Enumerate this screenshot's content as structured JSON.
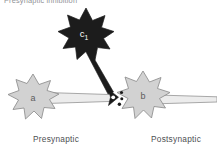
{
  "figure": {
    "title": "Presynaptic inhibition",
    "width": 217,
    "height": 159,
    "background": "#ffffff"
  },
  "labels": {
    "presynaptic": "Presynaptic",
    "postsynaptic": "Postsynaptic",
    "inhibitory_cell": "c",
    "inhibitory_cell_subscript": "1",
    "presynaptic_cell": "a",
    "postsynaptic_cell": "b"
  },
  "colors": {
    "cell_fill_light": "#d2d2d2",
    "cell_stroke": "#8c8c8c",
    "cell_fill_dark": "#1c1c1c",
    "axon_fill": "#e6e6e6",
    "axon_stroke": "#9a9a9a",
    "terminal_dark": "#1c1c1c",
    "vesicle": "#1c1c1c",
    "title_text": "#8f9196",
    "label_text": "#4d4f53"
  },
  "elements": {
    "inhibitory_neuron": {
      "name": "c1",
      "role": "inhibitory interneuron",
      "fill": "dark",
      "center_x": 86,
      "center_y": 35
    },
    "presynaptic_neuron": {
      "name": "a",
      "role": "presynaptic neuron",
      "fill": "light-grey",
      "center_x": 33,
      "center_y": 98
    },
    "postsynaptic_neuron": {
      "name": "b",
      "role": "postsynaptic neuron",
      "fill": "light-grey",
      "center_x": 143,
      "center_y": 98
    },
    "synaptic_cleft": {
      "vesicle_count": 3,
      "x": 118,
      "y": 97
    }
  }
}
